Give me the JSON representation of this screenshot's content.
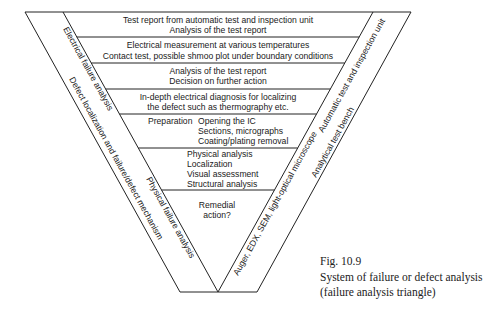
{
  "diagram": {
    "type": "inverted-triangle",
    "bands": [
      {
        "lines": [
          "Test report from automatic test and inspection unit",
          "Analysis of the test report"
        ]
      },
      {
        "lines": [
          "Electrical measurement at various temperatures",
          "Contact test, possible shmoo plot under boundary conditions"
        ]
      },
      {
        "lines": [
          "Analysis of the test report",
          "Decision on further action"
        ]
      },
      {
        "lines": [
          "In-depth electrical diagnosis for localizing",
          "the defect such as thermography etc."
        ]
      },
      {
        "label": "Preparation",
        "lines": [
          "Opening the IC",
          "Sections, micrographs",
          "Coating/plating removal"
        ]
      },
      {
        "lines": [
          "Physical analysis",
          "Localization",
          "Visual assessment",
          "Structural analysis"
        ]
      },
      {
        "lines": [
          "Remedial",
          "action?"
        ]
      }
    ],
    "left_side": {
      "electrical": "Electrical failure analysis",
      "defect": "Defect localization and failure/defect mechanism",
      "physical": "Physical failure analysis"
    },
    "right_side": {
      "automatic": "Automatic test and inspection unit",
      "bench": "Analytical test bench",
      "instruments": "Auger, EDX, SEM, light-optical microscope"
    }
  },
  "caption": {
    "figure": "Fig. 10.9",
    "line1": "System of failure or defect analysis",
    "line2": "(failure analysis triangle)"
  }
}
